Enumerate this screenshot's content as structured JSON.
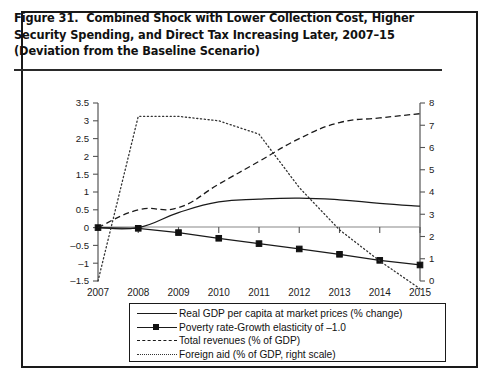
{
  "figure": {
    "number_label": "Figure 31.",
    "title": "Combined Shock with Lower Collection Cost, Higher Security Spending, and Direct Tax Increasing Later, 2007–15 (Deviation from the Baseline Scenario)"
  },
  "chart_data": {
    "type": "line",
    "title": "Combined Shock with Lower Collection Cost, Higher Security Spending, and Direct Tax Increasing Later, 2007–15 (Deviation from the Baseline Scenario)",
    "xlabel": "",
    "ylabel": "",
    "y2label": "",
    "grid": false,
    "legend_position": "below-plot",
    "categories": [
      "2007",
      "2008",
      "2009",
      "2010",
      "2011",
      "2012",
      "2013",
      "2014",
      "2015"
    ],
    "x": [
      2007,
      2008,
      2009,
      2010,
      2011,
      2012,
      2013,
      2014,
      2015
    ],
    "ylim": [
      -1.5,
      3.5
    ],
    "yticks": [
      -1.5,
      -1,
      -0.5,
      0,
      0.5,
      1,
      1.5,
      2,
      2.5,
      3,
      3.5
    ],
    "ytick_labels": [
      "–1.5",
      "–1",
      "–0.5",
      "0",
      "0.5",
      "1",
      "1.5",
      "2",
      "2.5",
      "3",
      "3.5"
    ],
    "y2lim": [
      0,
      8
    ],
    "y2ticks": [
      0,
      1,
      2,
      3,
      4,
      5,
      6,
      7,
      8
    ],
    "y2tick_labels": [
      "0",
      "1",
      "2",
      "3",
      "4",
      "5",
      "6",
      "7",
      "8"
    ],
    "series": [
      {
        "name": "Real GDP per capita at market prices (% change)",
        "style": "solid",
        "marker": "none",
        "axis": "left",
        "values": [
          0,
          0,
          0.42,
          0.72,
          0.8,
          0.83,
          0.78,
          0.68,
          0.6
        ]
      },
      {
        "name": "Poverty rate-Growth elasticity of –1.0",
        "style": "solid",
        "marker": "square",
        "axis": "left",
        "values": [
          0,
          -0.02,
          -0.14,
          -0.3,
          -0.45,
          -0.6,
          -0.75,
          -0.92,
          -1.05
        ]
      },
      {
        "name": "Total revenues (% of GDP)",
        "style": "dashed",
        "marker": "none",
        "axis": "left",
        "values": [
          0,
          0.5,
          0.56,
          1.22,
          1.86,
          2.5,
          2.95,
          3.08,
          3.2
        ]
      },
      {
        "name": "Foreign aid (% of GDP, right scale)",
        "style": "dotted",
        "marker": "none",
        "axis": "right",
        "values": [
          0.0,
          7.4,
          7.4,
          7.2,
          6.6,
          4.2,
          2.3,
          0.9,
          -0.35
        ]
      }
    ]
  },
  "legend": {
    "items": [
      {
        "label": "Real GDP per capita at market prices (% change)",
        "style": "solid",
        "marker": false
      },
      {
        "label": "Poverty rate-Growth elasticity of –1.0",
        "style": "solid",
        "marker": true
      },
      {
        "label": "Total revenues (% of GDP)",
        "style": "dashed",
        "marker": false
      },
      {
        "label": "Foreign aid (% of GDP, right scale)",
        "style": "dotted",
        "marker": false
      }
    ]
  },
  "colors": {
    "ink": "#1a1a1a",
    "axis": "#555555",
    "zero_line": "#888888",
    "background": "#ffffff"
  }
}
